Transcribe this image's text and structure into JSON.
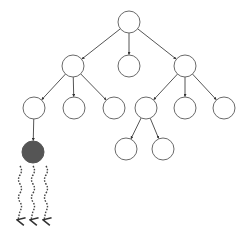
{
  "diagram": {
    "type": "tree",
    "colors": {
      "edge": "#555555",
      "node_stroke": "#6a6a6a",
      "node_fill": "#ffffff",
      "highlight_fill": "#555555",
      "arrow": "#444444"
    },
    "node_radius": 11,
    "nodes": [
      {
        "id": "root",
        "x": 129,
        "y": 22,
        "filled": false
      },
      {
        "id": "l1-left",
        "x": 73,
        "y": 66,
        "filled": false
      },
      {
        "id": "l1-mid",
        "x": 129,
        "y": 66,
        "filled": false
      },
      {
        "id": "l1-right",
        "x": 185,
        "y": 66,
        "filled": false
      },
      {
        "id": "l2-a",
        "x": 34,
        "y": 108,
        "filled": false
      },
      {
        "id": "l2-b",
        "x": 74,
        "y": 108,
        "filled": false
      },
      {
        "id": "l2-c",
        "x": 114,
        "y": 108,
        "filled": false
      },
      {
        "id": "l2-d",
        "x": 146,
        "y": 108,
        "filled": false
      },
      {
        "id": "l2-e",
        "x": 185,
        "y": 108,
        "filled": false
      },
      {
        "id": "l2-f",
        "x": 224,
        "y": 108,
        "filled": false
      },
      {
        "id": "l3-leaf-filled",
        "x": 33,
        "y": 152,
        "filled": true
      },
      {
        "id": "l3-g",
        "x": 126,
        "y": 149,
        "filled": false
      },
      {
        "id": "l3-h",
        "x": 163,
        "y": 149,
        "filled": false
      }
    ],
    "edges": [
      [
        "root",
        "l1-left"
      ],
      [
        "root",
        "l1-mid"
      ],
      [
        "root",
        "l1-right"
      ],
      [
        "l1-left",
        "l2-a"
      ],
      [
        "l1-left",
        "l2-b"
      ],
      [
        "l1-left",
        "l2-c"
      ],
      [
        "l1-right",
        "l2-d"
      ],
      [
        "l1-right",
        "l2-e"
      ],
      [
        "l1-right",
        "l2-f"
      ],
      [
        "l2-a",
        "l3-leaf-filled"
      ],
      [
        "l2-d",
        "l3-g"
      ],
      [
        "l2-d",
        "l3-h"
      ]
    ],
    "wavy_arrows": [
      {
        "x": 20,
        "y_start": 166,
        "y_end": 220
      },
      {
        "x": 33,
        "y_start": 166,
        "y_end": 220
      },
      {
        "x": 46,
        "y_start": 166,
        "y_end": 220
      }
    ]
  }
}
